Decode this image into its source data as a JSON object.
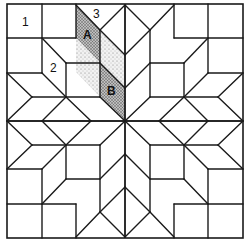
{
  "diagram": {
    "colors": {
      "line": "#1a1a1a",
      "background": "#ffffff",
      "dark_stipple": "#8c8c8c",
      "light_stipple": "#d2d2d2"
    },
    "labels": {
      "piece_1": "1",
      "piece_2": "2",
      "piece_3": "3",
      "piece_a": "A",
      "piece_b": "B"
    },
    "label_positions": {
      "piece_1": [
        22,
        26
      ],
      "piece_2": [
        50,
        72
      ],
      "piece_3": [
        93,
        18
      ],
      "piece_a": [
        83,
        39
      ],
      "piece_b": [
        107,
        95
      ]
    },
    "border": {
      "x": 7,
      "y": 4,
      "width": 236,
      "height": 234
    },
    "center": [
      125,
      121
    ],
    "quadrant_segments": [
      [
        7,
        38,
        76,
        38
      ],
      [
        42,
        4,
        42,
        73
      ],
      [
        76,
        4,
        76,
        38
      ],
      [
        7,
        73,
        42,
        73
      ],
      [
        76,
        5,
        100,
        30
      ],
      [
        100,
        30,
        125,
        5
      ],
      [
        100,
        30,
        100,
        97
      ],
      [
        42,
        38,
        66,
        63
      ],
      [
        66,
        63,
        66,
        97
      ],
      [
        66,
        63,
        100,
        63
      ],
      [
        42,
        73,
        66,
        97
      ],
      [
        32,
        97,
        100,
        97
      ],
      [
        7,
        73,
        32,
        97
      ],
      [
        32,
        97,
        7,
        121
      ],
      [
        66,
        97,
        42,
        121
      ],
      [
        66,
        97,
        91,
        121
      ],
      [
        7,
        121,
        125,
        121
      ],
      [
        100,
        97,
        125,
        121
      ],
      [
        100,
        63,
        125,
        88
      ],
      [
        100,
        30,
        125,
        55
      ],
      [
        125,
        5,
        125,
        121
      ]
    ],
    "shaded_pieces": [
      {
        "name": "piece-a",
        "tone": "dark",
        "points": [
          [
            76,
            5
          ],
          [
            100,
            30
          ],
          [
            100,
            63
          ],
          [
            76,
            38
          ]
        ]
      },
      {
        "name": "piece-a-adjacent",
        "tone": "light",
        "points": [
          [
            76,
            38
          ],
          [
            100,
            63
          ],
          [
            100,
            97
          ],
          [
            76,
            72
          ]
        ]
      },
      {
        "name": "piece-b-adjacent",
        "tone": "light",
        "points": [
          [
            100,
            30
          ],
          [
            125,
            55
          ],
          [
            125,
            88
          ],
          [
            100,
            63
          ]
        ]
      },
      {
        "name": "piece-b",
        "tone": "dark",
        "points": [
          [
            100,
            63
          ],
          [
            125,
            88
          ],
          [
            125,
            121
          ],
          [
            100,
            97
          ]
        ]
      }
    ]
  }
}
